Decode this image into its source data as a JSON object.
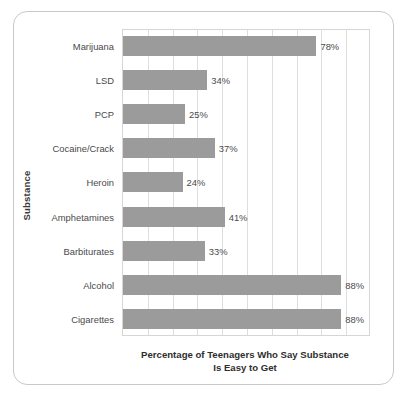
{
  "figure": {
    "frame_color": "#c9c9c9",
    "background": "#ffffff"
  },
  "axes": {
    "y_title": "Substance",
    "x_title_line1": "Percentage of Teenagers Who Say Substance",
    "x_title_line2": "Is Easy to Get"
  },
  "chart_data": {
    "type": "bar",
    "orientation": "horizontal",
    "title": "",
    "subtitle": "",
    "xlabel": "Percentage of Teenagers Who Say Substance Is Easy to Get",
    "ylabel": "Substance",
    "xlim": [
      0,
      100
    ],
    "grid": true,
    "grid_interval": 10,
    "legend": false,
    "bar_color": "#9b9b9b",
    "value_suffix": "%",
    "categories": [
      "Marijuana",
      "LSD",
      "PCP",
      "Cocaine/Crack",
      "Heroin",
      "Amphetamines",
      "Barbiturates",
      "Alcohol",
      "Cigarettes"
    ],
    "values": [
      78,
      34,
      25,
      37,
      24,
      41,
      33,
      88,
      88
    ],
    "labels": [
      "78%",
      "34%",
      "25%",
      "37%",
      "24%",
      "41%",
      "33%",
      "88%",
      "88%"
    ]
  }
}
